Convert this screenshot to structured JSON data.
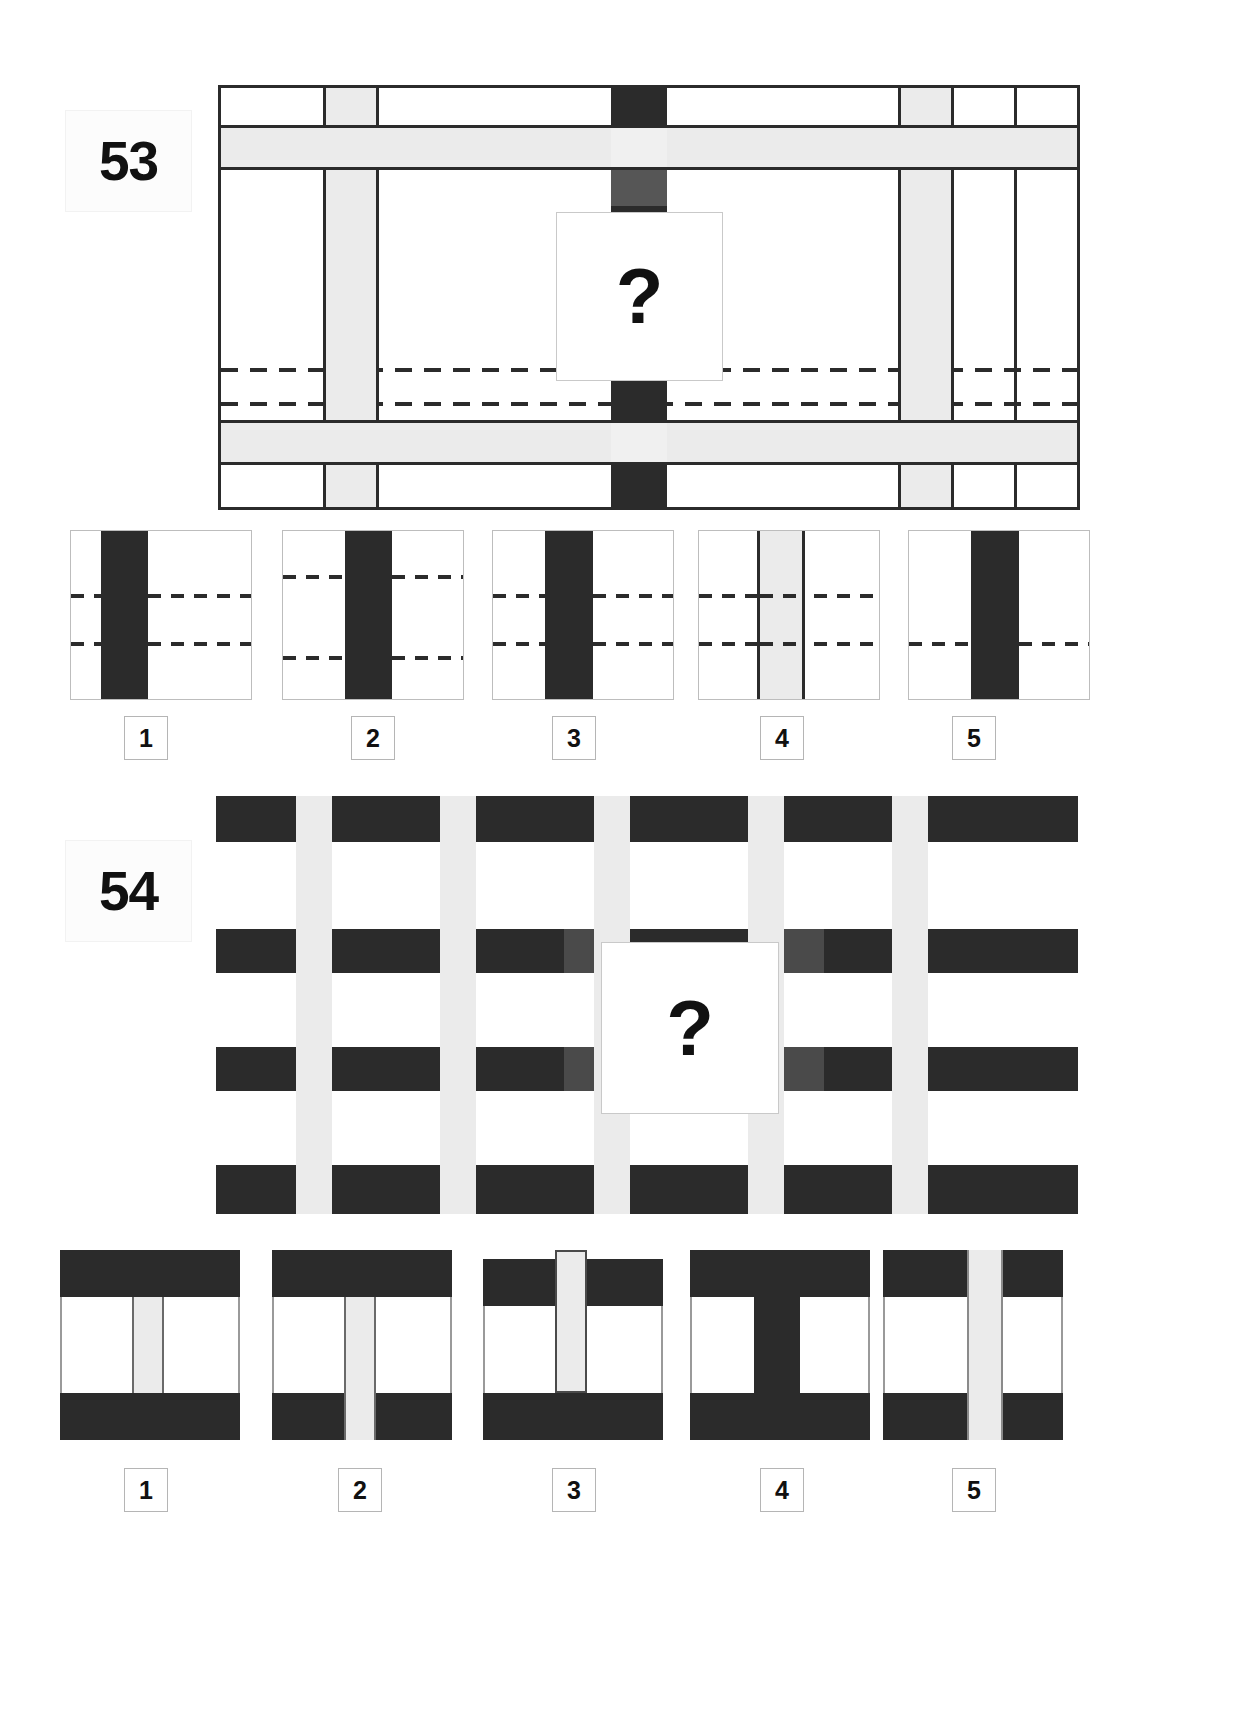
{
  "page": {
    "background": "#ffffff",
    "ink": "#2b2b2b",
    "light_stripe": "#ebebeb",
    "border": "#bdbdbd",
    "width": 1240,
    "height": 1723
  },
  "puzzles": [
    {
      "id": "puzzle-53",
      "number": "53",
      "question_mark": "?",
      "matrix_description": "Wide rectangular lattice of vertical black/light bars crossed by horizontal light bands and two dashed horizontal rules; a white square with a question mark covers the centre.",
      "options": [
        {
          "label": "1",
          "description": "white tile, wide black vertical bar left-of-centre, two short dashes left, two dashes right"
        },
        {
          "label": "2",
          "description": "white tile, wide black vertical bar at centre, dashes entering from both sides at upper and lower rules"
        },
        {
          "label": "3",
          "description": "white tile, wide black vertical bar left-of-centre, two full dashed rules crossing both sides"
        },
        {
          "label": "4",
          "description": "white tile, light grey vertical bar outlined in black at centre, two dashed rules crossing all the way through"
        },
        {
          "label": "5",
          "description": "white tile, wide black vertical bar right-of-centre, single dashed rule crossing"
        }
      ]
    },
    {
      "id": "puzzle-54",
      "number": "54",
      "question_mark": "?",
      "matrix_description": "Dense lattice of thick black horizontal bands overlaid by pale vertical bars; a white square with a question mark covers the centre.",
      "options": [
        {
          "label": "1",
          "description": "black band top and bottom, white field with one pale vertical bar centred"
        },
        {
          "label": "2",
          "description": "black band top and bottom, single pale vertical bar running through the bottom black band"
        },
        {
          "label": "3",
          "description": "black band top and bottom, pale vertical bar breaking through the top black band"
        },
        {
          "label": "4",
          "description": "black T-shaped mass: black band at top with wide black column down the centre, black band at bottom"
        },
        {
          "label": "5",
          "description": "black band top and bottom, pale vertical bar right-of-centre running full height"
        }
      ]
    }
  ]
}
